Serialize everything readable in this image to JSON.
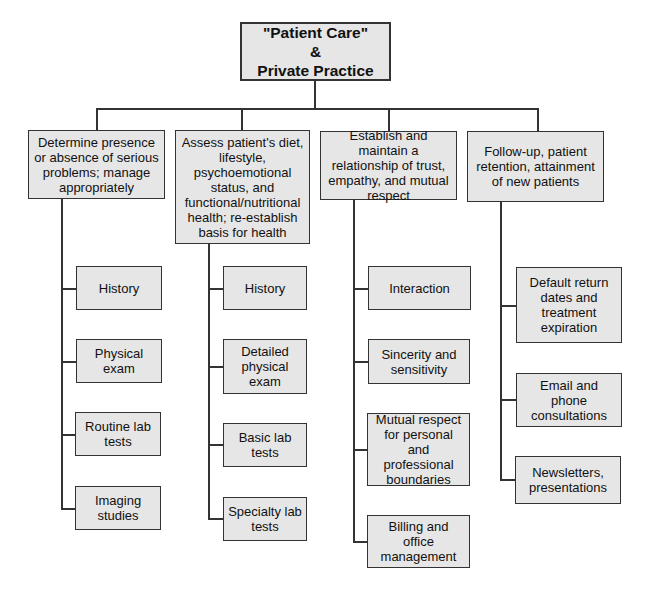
{
  "root": {
    "lines": [
      "\"Patient Care\"",
      "&",
      "Private Practice"
    ]
  },
  "columns": [
    {
      "title": "Determine presence or absence of serious problems; manage appropriately",
      "children": [
        "History",
        "Physical exam",
        "Routine lab tests",
        "Imaging studies"
      ]
    },
    {
      "title": "Assess patient's diet, lifestyle, psychoemotional status, and functional/nutritional health; re-establish basis for health",
      "children": [
        "History",
        "Detailed physical exam",
        "Basic lab tests",
        "Specialty lab tests"
      ]
    },
    {
      "title": "Establish and maintain a relationship of trust, empathy, and mutual respect",
      "children": [
        "Interaction",
        "Sincerity and sensitivity",
        "Mutual respect for personal and professional boundaries",
        "Billing and office management"
      ]
    },
    {
      "title": "Follow-up, patient retention, attainment of new patients",
      "children": [
        "Default return dates and treatment expiration",
        "Email and phone consultations",
        "Newsletters, presentations"
      ]
    }
  ],
  "colors": {
    "box_fill": "#e6e6e6",
    "border": "#333333",
    "background": "#ffffff"
  }
}
